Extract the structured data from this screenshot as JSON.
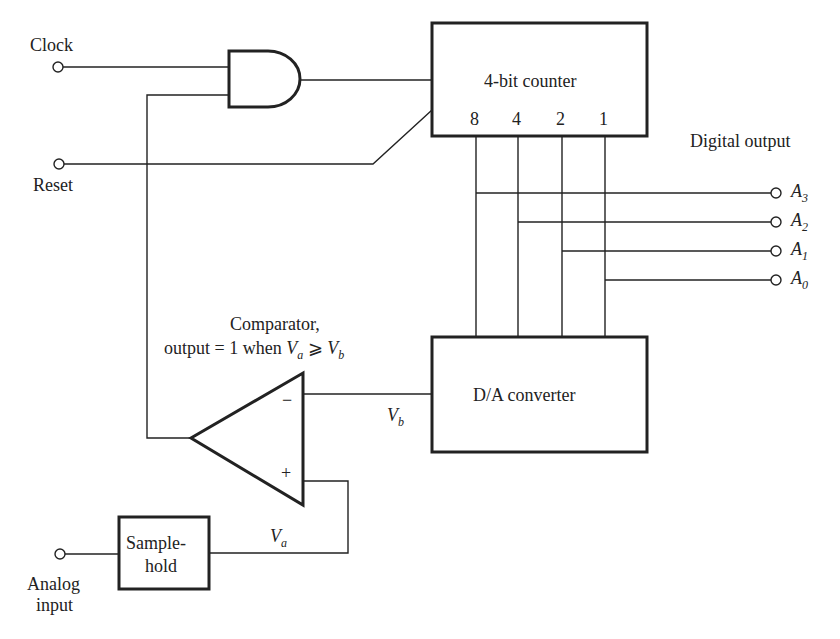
{
  "inputs": {
    "clock": "Clock",
    "reset": "Reset",
    "analog_line1": "Analog",
    "analog_line2": "input"
  },
  "blocks": {
    "counter": {
      "label": "4-bit counter",
      "bits": [
        "8",
        "4",
        "2",
        "1"
      ]
    },
    "dac": {
      "label": "D/A converter"
    },
    "sample_hold": {
      "line1": "Sample-",
      "line2": "hold"
    },
    "comparator": {
      "title_line1": "Comparator,",
      "title_line2_prefix": "output = 1 when ",
      "va": "V",
      "va_sub": "a",
      "op": " ⩾ ",
      "vb": "V",
      "vb_sub": "b",
      "minus": "−",
      "plus": "+"
    },
    "and_gate": {
      "type": "AND"
    }
  },
  "signals": {
    "vb": "V",
    "vb_sub": "b",
    "va": "V",
    "va_sub": "a"
  },
  "outputs": {
    "title": "Digital output",
    "items": [
      {
        "name": "A",
        "sub": "3"
      },
      {
        "name": "A",
        "sub": "2"
      },
      {
        "name": "A",
        "sub": "1"
      },
      {
        "name": "A",
        "sub": "0"
      }
    ]
  }
}
